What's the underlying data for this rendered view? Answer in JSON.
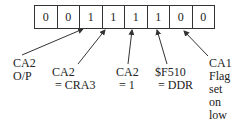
{
  "register": {
    "bits": [
      "0",
      "0",
      "1",
      "1",
      "1",
      "1",
      "0",
      "0"
    ]
  },
  "labels": [
    {
      "id": "ca2-op",
      "lines": [
        "CA2",
        "O/P"
      ]
    },
    {
      "id": "ca2-cra3",
      "lines": [
        "CA2",
        " = CRA3"
      ]
    },
    {
      "id": "ca2-1",
      "lines": [
        "CA2",
        " = 1"
      ]
    },
    {
      "id": "f510-ddr",
      "lines": [
        "$F510",
        " = DDR"
      ]
    },
    {
      "id": "ca1-flag",
      "lines": [
        "CA1",
        "Flag",
        "set",
        "on",
        "low"
      ]
    }
  ]
}
